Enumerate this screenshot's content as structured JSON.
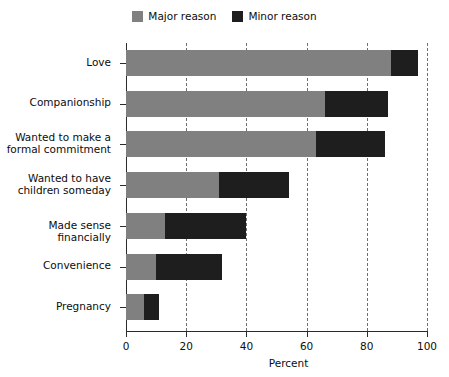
{
  "chart_data": {
    "type": "bar",
    "orientation": "horizontal",
    "stacked": true,
    "title": "",
    "xlabel": "Percent",
    "ylabel": "",
    "xlim": [
      0,
      100
    ],
    "xticks": [
      0,
      20,
      40,
      60,
      80,
      100
    ],
    "xtick_labels": [
      "0",
      "20",
      "40",
      "60",
      "80",
      "100"
    ],
    "grid": "vertical-dashed",
    "legend_position": "top-center",
    "categories": [
      "Love",
      "Companionship",
      "Wanted to make a\nformal commitment",
      "Wanted to have\nchildren someday",
      "Made sense financially",
      "Convenience",
      "Pregnancy"
    ],
    "series": [
      {
        "name": "Major reason",
        "color": "#808080",
        "values": [
          88,
          66,
          63,
          31,
          13,
          10,
          6
        ]
      },
      {
        "name": "Minor reason",
        "color": "#1e1e1e",
        "values": [
          9,
          21,
          23,
          23,
          27,
          22,
          5
        ]
      }
    ],
    "totals": [
      97,
      87,
      86,
      54,
      40,
      32,
      11
    ]
  },
  "legend": {
    "items": [
      {
        "label": "Major reason",
        "color": "#808080",
        "swatch_name": "legend-swatch-major"
      },
      {
        "label": "Minor reason",
        "color": "#1e1e1e",
        "swatch_name": "legend-swatch-minor"
      }
    ]
  },
  "axis": {
    "x_title": "Percent"
  }
}
